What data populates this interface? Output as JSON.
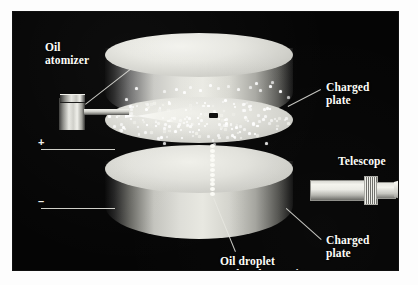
{
  "figure": {
    "background_color": "#ffffff",
    "panel_color": "#050505",
    "label_color": "#fdfdf8"
  },
  "labels": {
    "oil_atomizer": "Oil\natomizer",
    "charged_plate_top": "Charged\nplate",
    "telescope": "Telescope",
    "charged_plate_bottom": "Charged\nplate",
    "oil_droplet": "Oil droplet\nunder observation"
  },
  "terminals": {
    "positive": "+",
    "negative": "–"
  },
  "components": {
    "atomizer": "oil-atomizer",
    "upper_plate": "charged-plate-upper",
    "lower_plate": "charged-plate-lower",
    "telescope": "observation-telescope",
    "observed_droplet": "oil-droplet-marker",
    "droplet_trail": "falling-droplet-trail",
    "spray": "oil-mist-spray"
  },
  "droplet_cloud": {
    "count": 170,
    "trail_count": 11,
    "color": "#ffffff"
  }
}
